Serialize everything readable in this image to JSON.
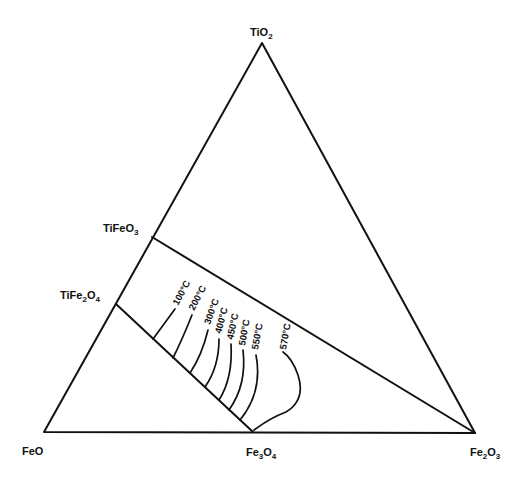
{
  "diagram": {
    "type": "ternary-phase-diagram",
    "vertices": {
      "top": {
        "label": "TiO",
        "sub": "2"
      },
      "bottom_left": {
        "label": "FeO",
        "sub": ""
      },
      "bottom_right": {
        "label": "Fe",
        "sub": "2",
        "label2": "O",
        "sub2": "3"
      }
    },
    "edge_points": {
      "bottom_mid": {
        "label": "Fe",
        "sub": "3",
        "label2": "O",
        "sub2": "4"
      },
      "left_upper": {
        "label": "TiFeO",
        "sub": "3"
      },
      "left_lower": {
        "label": "TiFe",
        "sub": "2",
        "label2": "O",
        "sub2": "4"
      }
    },
    "isotherms": [
      {
        "label": "100°C"
      },
      {
        "label": "200°C"
      },
      {
        "label": "300°C"
      },
      {
        "label": "400°C"
      },
      {
        "label": "450°C"
      },
      {
        "label": "500°C"
      },
      {
        "label": "550°C"
      },
      {
        "label": "570°C"
      }
    ]
  }
}
